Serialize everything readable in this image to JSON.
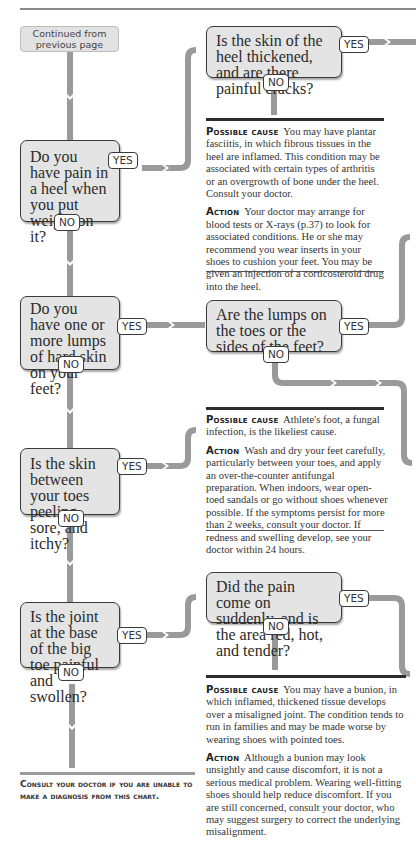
{
  "start": {
    "label": "Continued from previous page"
  },
  "questions": [
    {
      "id": "q1",
      "text": "Do you have pain in a heel when you put weight on it?",
      "yes": "YES",
      "no": "NO"
    },
    {
      "id": "q1a",
      "text": "Is the skin of the heel thickened, and are there painful cracks?",
      "yes": "YES",
      "no": "NO"
    },
    {
      "id": "q2",
      "text": "Do you have one or more lumps of hard skin on your feet?",
      "yes": "YES",
      "no": "NO"
    },
    {
      "id": "q2a",
      "text": "Are the lumps on the toes or the sides of the feet?",
      "yes": "YES",
      "no": "NO"
    },
    {
      "id": "q3",
      "text": "Is the skin between your toes peeling, sore, and itchy?",
      "yes": "YES",
      "no": "NO"
    },
    {
      "id": "q4",
      "text": "Is the joint at the base of the big toe painful and swollen?",
      "yes": "YES",
      "no": "NO"
    },
    {
      "id": "q4a",
      "text": "Did the pain come on suddenly, and is the area red, hot, and tender?",
      "yes": "YES",
      "no": "NO"
    }
  ],
  "results": [
    {
      "cause_label": "Possible cause",
      "cause_text": "You may have plantar fasciitis, in which fibrous tissues in the heel are inflamed. This condition may be associated with certain types of arthritis or an overgrowth of bone under the heel. Consult your doctor.",
      "action_label": "Action",
      "action_text": "Your doctor may arrange for blood tests or X-rays (p.37) to look for associated conditions. He or she may recommend you wear inserts in your shoes to cushion your feet. You may be given an injection of a corticosteroid drug into the heel."
    },
    {
      "cause_label": "Possible cause",
      "cause_text": "Athlete's foot, a fungal infection, is the likeliest cause.",
      "action_label": "Action",
      "action_text": "Wash and dry your feet carefully, particularly between your toes, and apply an over-the-counter antifungal preparation. When indoors, wear open-toed sandals or go without shoes whenever possible. If the symptoms persist for more than 2 weeks, consult your doctor. If redness and swelling develop, see your doctor within 24 hours."
    },
    {
      "cause_label": "Possible cause",
      "cause_text": "You may have a bunion, in which inflamed, thickened tissue develops over a misaligned joint. The condition tends to run in families and may be made worse by wearing shoes with pointed toes.",
      "action_label": "Action",
      "action_text": "Although a bunion may look unsightly and cause discomfort, it is not a serious medical problem. Wearing well-fitting shoes should help reduce discomfort. If you are still concerned, consult your doctor, who may suggest surgery to correct the underlying misalignment."
    }
  ],
  "footer": {
    "consult": "Consult your doctor if you are unable to make a diagnosis from this chart."
  },
  "colors": {
    "box_fill": "#e4e4e4",
    "box_border": "#3a3a3a",
    "connector": "#9a9a9a",
    "rule": "#2c2c2c"
  }
}
